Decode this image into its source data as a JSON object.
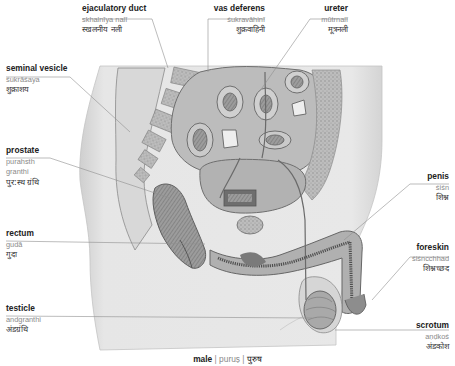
{
  "figure": {
    "title": "male",
    "title_transliteration": "puruṣ",
    "title_hindi": "पुरुष",
    "separator": "|"
  },
  "labels": [
    {
      "id": "ejaculatory-duct",
      "en": "ejaculatory duct",
      "tr": "skhalnīya nalī",
      "hi": "स्खलनीय नली"
    },
    {
      "id": "vas-deferens",
      "en": "vas deferens",
      "tr": "śukravāhinī",
      "hi": "शुक्रवाहिनी"
    },
    {
      "id": "ureter",
      "en": "ureter",
      "tr": "mūtrnalī",
      "hi": "मूत्रनली"
    },
    {
      "id": "seminal-vesicle",
      "en": "seminal vesicle",
      "tr": "śukrāśaya",
      "hi": "शुक्राशय"
    },
    {
      "id": "prostate",
      "en": "prostate",
      "tr": "purahsth",
      "tr2": "granthi",
      "hi": "पुर:स्थ ग्रंथि"
    },
    {
      "id": "rectum",
      "en": "rectum",
      "tr": "gudā",
      "hi": "गुदा"
    },
    {
      "id": "testicle",
      "en": "testicle",
      "tr": "andgranthi",
      "hi": "अंडग्रंथि"
    },
    {
      "id": "penis",
      "en": "penis",
      "tr": "śiśn",
      "hi": "शिश्न"
    },
    {
      "id": "foreskin",
      "en": "foreskin",
      "tr": "śiśncchhad",
      "hi": "शिश्नच्छद"
    },
    {
      "id": "scrotum",
      "en": "scrotum",
      "tr": "aṇḍkoś",
      "hi": "अंडकोश"
    }
  ],
  "colors": {
    "body_tone": "#e4e4e4",
    "body_edge": "#c8c8c8",
    "tissue_dark": "#7a7a7a",
    "tissue_mid": "#a9a9a9",
    "tissue_light": "#d6d6d6",
    "leader_line": "#8f8f8f",
    "label_text": "#222222",
    "translit_text": "#8a8a8a"
  }
}
